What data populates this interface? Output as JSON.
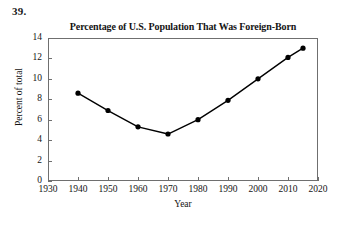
{
  "problem": {
    "number": "39."
  },
  "chart_data": {
    "type": "line",
    "title": "Percentage of U.S. Population That Was Foreign-Born",
    "xlabel": "Year",
    "ylabel": "Percent of total",
    "x": [
      1940,
      1950,
      1960,
      1970,
      1980,
      1990,
      2000,
      2010,
      2015
    ],
    "values": [
      8.6,
      6.9,
      5.3,
      4.6,
      6.0,
      7.9,
      10.0,
      12.1,
      13.0
    ],
    "series": [
      {
        "name": "Percent of total",
        "values": [
          8.6,
          6.9,
          5.3,
          4.6,
          6.0,
          7.9,
          10.0,
          12.1,
          13.0
        ]
      }
    ],
    "xlim": [
      1930,
      2020
    ],
    "ylim": [
      0,
      14
    ],
    "xticks": [
      "1930",
      "1940",
      "1950",
      "1960",
      "1970",
      "1980",
      "1990",
      "2000",
      "2010",
      "2020"
    ],
    "yticks": [
      "0",
      "2",
      "4",
      "6",
      "8",
      "10",
      "12",
      "14"
    ],
    "grid": false,
    "legend": false,
    "marker": "filled-circle",
    "line_color": "#000000",
    "marker_color": "#000000",
    "axis_color": "#6f6f6f",
    "background_color": "#ffffff"
  }
}
